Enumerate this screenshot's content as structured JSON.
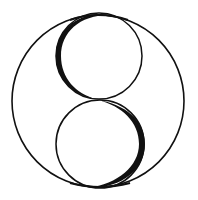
{
  "figure": {
    "colors": {
      "background": "#ffffff",
      "stroke": "#111111"
    },
    "outer_circle": {
      "cx": 98,
      "cy": 101,
      "r": 86,
      "stroke_width": 1.6
    },
    "upper_loop": {
      "cx": 99,
      "cy": 56,
      "r": 43
    },
    "lower_loop": {
      "cx": 100,
      "cy": 144,
      "r": 44
    }
  }
}
